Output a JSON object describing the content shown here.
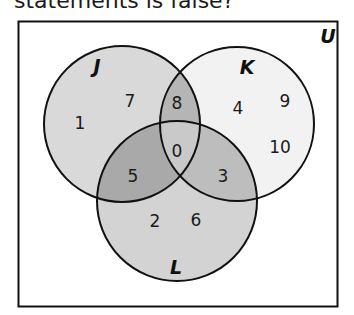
{
  "question": {
    "text": "statements is false?"
  },
  "venn": {
    "universe_label": "U",
    "sets": [
      {
        "id": "J",
        "label": "J"
      },
      {
        "id": "K",
        "label": "K"
      },
      {
        "id": "L",
        "label": "L"
      }
    ],
    "regions": {
      "J_only": [
        "7",
        "1"
      ],
      "K_only": [
        "4",
        "9",
        "10"
      ],
      "L_only": [
        "2",
        "6"
      ],
      "J_and_K_only": [
        "8"
      ],
      "J_and_L_only": [
        "5"
      ],
      "K_and_L_only": [
        "3"
      ],
      "J_and_K_and_L": [
        "0"
      ]
    },
    "colors": {
      "J_only": "#d9d9d9",
      "K_only": "#f2f2f2",
      "L_only": "#d3d3d3",
      "J_and_K": "#b5b5b5",
      "J_and_L": "#a9a9a9",
      "K_and_L": "#bdbdbd",
      "J_and_K_and_L": "#c9c9c9",
      "outline": "#111111"
    }
  }
}
